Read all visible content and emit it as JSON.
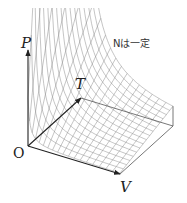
{
  "figure": {
    "relation": "P proportional to T / V",
    "axes": {
      "p_label": "P",
      "t_label": "T",
      "v_label": "V",
      "origin_label": "O"
    },
    "note": "Nは一定",
    "grid": {
      "t_lines": 16,
      "v_lines": 18
    },
    "colors": {
      "axis": "#222222",
      "mesh": "#8a8a8a",
      "background": "#ffffff"
    }
  }
}
